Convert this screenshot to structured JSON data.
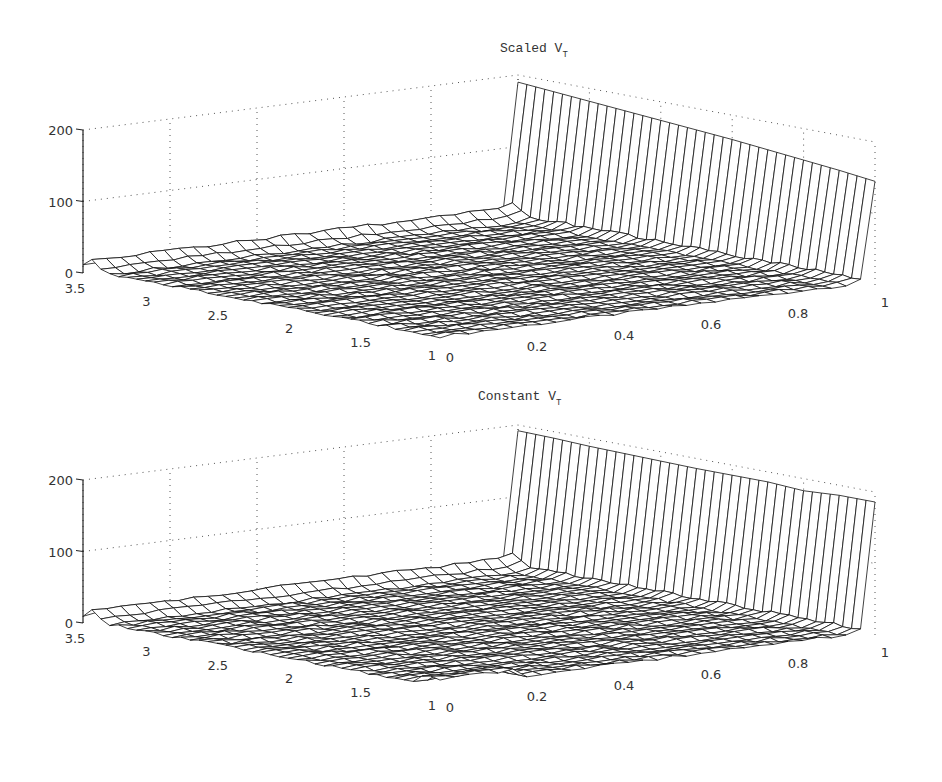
{
  "chart_data": [
    {
      "type": "surface3d",
      "title": "Scaled V_T",
      "title_main": "Scaled V",
      "title_sub": "T",
      "x_axis": {
        "label": "",
        "range": [
          0,
          1
        ],
        "ticks": [
          "0",
          "0.2",
          "0.4",
          "0.6",
          "0.8",
          "1"
        ]
      },
      "y_axis": {
        "label": "",
        "range": [
          1,
          3.5
        ],
        "ticks": [
          "1",
          "1.5",
          "2",
          "2.5",
          "3",
          "3.5"
        ]
      },
      "z_axis": {
        "label": "",
        "range": [
          0,
          200
        ],
        "ticks": [
          "0",
          "100",
          "200"
        ]
      },
      "grid": true,
      "description": "Surface near zero over most of domain, small ridge (~15) along y=3.5 edge, tall wall at x=1 across all y, height decreasing from ~190 at y=3.5 to ~145 at y=1",
      "wall_at_x1": {
        "y": [
          3.5,
          3.25,
          3.0,
          2.75,
          2.5,
          2.25,
          2.0,
          1.75,
          1.5,
          1.25,
          1.0
        ],
        "z": [
          190,
          186,
          182,
          178,
          174,
          170,
          166,
          161,
          156,
          151,
          145
        ]
      },
      "ridge_at_y35_height": 15
    },
    {
      "type": "surface3d",
      "title": "Constant V_T",
      "title_main": "Constant V",
      "title_sub": "T",
      "x_axis": {
        "label": "",
        "range": [
          0,
          1
        ],
        "ticks": [
          "0",
          "0.2",
          "0.4",
          "0.6",
          "0.8",
          "1"
        ]
      },
      "y_axis": {
        "label": "",
        "range": [
          1,
          3.5
        ],
        "ticks": [
          "1",
          "1.5",
          "2",
          "2.5",
          "3",
          "3.5"
        ]
      },
      "z_axis": {
        "label": "",
        "range": [
          0,
          200
        ],
        "ticks": [
          "0",
          "100",
          "200"
        ]
      },
      "grid": true,
      "description": "Surface near zero over most of domain, small ridges near y=3.5 and y=1 edges, tall wall at x=1 across all y, roughly constant height ~185-195",
      "wall_at_x1": {
        "y": [
          3.5,
          3.25,
          3.0,
          2.75,
          2.5,
          2.25,
          2.0,
          1.75,
          1.5,
          1.25,
          1.0
        ],
        "z": [
          192,
          191,
          189,
          188,
          187,
          186,
          186,
          186,
          183,
          186,
          186
        ]
      },
      "ridge_at_y35_height": 15
    }
  ]
}
